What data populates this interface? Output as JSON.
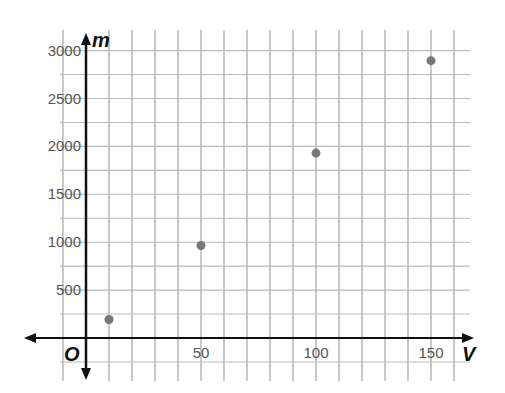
{
  "chart_data": {
    "type": "scatter",
    "title": "",
    "xlabel": "V",
    "ylabel": "m",
    "origin_label": "O",
    "xlim": [
      -10,
      160
    ],
    "ylim": [
      -250,
      3000
    ],
    "x_ticks": [
      50,
      100,
      150
    ],
    "y_ticks": [
      500,
      1000,
      1500,
      2000,
      2500,
      3000
    ],
    "x_grid_step": 10,
    "y_grid_step": 250,
    "grid": true,
    "legend": null,
    "points": [
      {
        "x": 10,
        "y": 193
      },
      {
        "x": 50,
        "y": 965
      },
      {
        "x": 100,
        "y": 1930
      },
      {
        "x": 150,
        "y": 2895
      }
    ],
    "colors": {
      "point": "#777777",
      "grid": "#9a9a9a",
      "axis": "#111111"
    }
  }
}
